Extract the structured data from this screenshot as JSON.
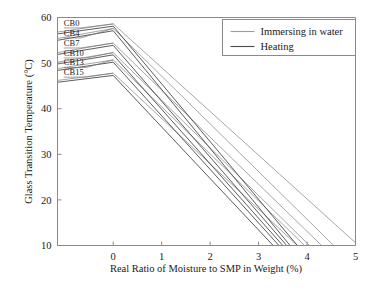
{
  "chart_data": {
    "type": "line",
    "title": "",
    "xlabel": "Real Ratio of Moisture to SMP in Weight (%)",
    "ylabel": "Glass Transition Temperature (°C)",
    "xlim": [
      -1.15,
      5
    ],
    "ylim": [
      10,
      60
    ],
    "xticks": [
      0,
      1,
      2,
      3,
      4,
      5
    ],
    "xticklabels": [
      "0",
      "1",
      "2",
      "3",
      "4",
      "5"
    ],
    "yticks": [
      10,
      20,
      30,
      40,
      50,
      60
    ],
    "yticklabels": [
      "10",
      "20",
      "30",
      "40",
      "50",
      "60"
    ],
    "grid": false,
    "legend_position": "top-right",
    "legend": [
      {
        "label": "Immersing in water",
        "color": "#9c9c9c"
      },
      {
        "label": "Heating",
        "color": "#4a4a4a"
      }
    ],
    "sample_labels": [
      "CB0",
      "CB4",
      "CB7",
      "CB10",
      "CB13",
      "CB15"
    ],
    "series": [
      {
        "name": "CB0 Immersing in water",
        "group": "Immersing in water",
        "sample": "CB0",
        "color": "#9c9c9c",
        "x": [
          -1.15,
          0,
          5.0
        ],
        "y": [
          56.8,
          58.6,
          10.6
        ]
      },
      {
        "name": "CB4 Immersing in water",
        "group": "Immersing in water",
        "sample": "CB4",
        "color": "#9c9c9c",
        "x": [
          -1.15,
          0,
          4.55
        ],
        "y": [
          55.4,
          57.6,
          10.0
        ]
      },
      {
        "name": "CB7 Immersing in water",
        "group": "Immersing in water",
        "sample": "CB7",
        "color": "#9c9c9c",
        "x": [
          -1.15,
          0,
          4.3
        ],
        "y": [
          52.3,
          54.4,
          10.0
        ]
      },
      {
        "name": "CB10 Immersing in water",
        "group": "Immersing in water",
        "sample": "CB10",
        "color": "#9c9c9c",
        "x": [
          -1.15,
          0,
          4.05
        ],
        "y": [
          50.2,
          52.3,
          10.0
        ]
      },
      {
        "name": "CB13 Immersing in water",
        "group": "Immersing in water",
        "sample": "CB13",
        "color": "#9c9c9c",
        "x": [
          -1.15,
          0,
          3.95
        ],
        "y": [
          48.8,
          50.7,
          10.0
        ]
      },
      {
        "name": "CB15 Immersing in water",
        "group": "Immersing in water",
        "sample": "CB15",
        "color": "#9c9c9c",
        "x": [
          -1.15,
          0,
          3.8
        ],
        "y": [
          46.2,
          47.8,
          10.0
        ]
      },
      {
        "name": "CB0 Heating",
        "group": "Heating",
        "sample": "CB0",
        "color": "#4a4a4a",
        "x": [
          -1.15,
          0,
          3.8
        ],
        "y": [
          56.4,
          58.1,
          10.0
        ]
      },
      {
        "name": "CB4 Heating",
        "group": "Heating",
        "sample": "CB4",
        "color": "#4a4a4a",
        "x": [
          -1.15,
          0,
          3.65
        ],
        "y": [
          55.0,
          57.1,
          10.0
        ]
      },
      {
        "name": "CB7 Heating",
        "group": "Heating",
        "sample": "CB7",
        "color": "#4a4a4a",
        "x": [
          -1.15,
          0,
          3.58
        ],
        "y": [
          51.9,
          53.9,
          10.0
        ]
      },
      {
        "name": "CB10 Heating",
        "group": "Heating",
        "sample": "CB10",
        "color": "#4a4a4a",
        "x": [
          -1.15,
          0,
          3.5
        ],
        "y": [
          49.8,
          51.8,
          10.0
        ]
      },
      {
        "name": "CB13 Heating",
        "group": "Heating",
        "sample": "CB13",
        "color": "#4a4a4a",
        "x": [
          -1.15,
          0,
          3.42
        ],
        "y": [
          48.4,
          50.2,
          10.0
        ]
      },
      {
        "name": "CB15 Heating",
        "group": "Heating",
        "sample": "CB15",
        "color": "#4a4a4a",
        "x": [
          -1.15,
          0,
          3.3
        ],
        "y": [
          45.8,
          47.3,
          10.0
        ]
      }
    ],
    "label_anchors": [
      {
        "label": "CB0",
        "text_x": -1.02,
        "text_y": 58.2,
        "line_to_x": 0.0,
        "line_to_y": 58.6
      },
      {
        "label": "CB4",
        "text_x": -1.02,
        "text_y": 56.0,
        "line_to_x": 0.0,
        "line_to_y": 57.6
      },
      {
        "label": "CB7",
        "text_x": -1.02,
        "text_y": 53.8,
        "line_to_x": 0.0,
        "line_to_y": 54.4
      },
      {
        "label": "CB10",
        "text_x": -1.02,
        "text_y": 51.6,
        "line_to_x": 0.0,
        "line_to_y": 52.3
      },
      {
        "label": "CB13",
        "text_x": -1.02,
        "text_y": 49.5,
        "line_to_x": 0.0,
        "line_to_y": 50.7
      },
      {
        "label": "CB15",
        "text_x": -1.02,
        "text_y": 47.4,
        "line_to_x": 0.0,
        "line_to_y": 47.8
      }
    ]
  },
  "axes": {
    "frame_color": "#8a8a8a",
    "tick_color": "#8a8a8a"
  }
}
